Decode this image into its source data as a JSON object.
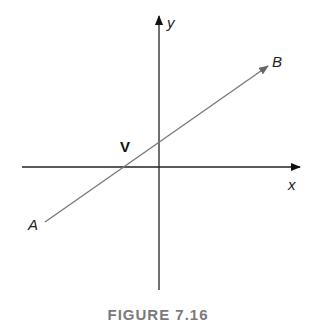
{
  "figure": {
    "caption": "FIGURE 7.16",
    "axes": {
      "x_label": "x",
      "y_label": "y"
    },
    "line": {
      "start_label": "A",
      "end_label": "B",
      "color": "#777777"
    },
    "point": {
      "label": "V"
    }
  }
}
